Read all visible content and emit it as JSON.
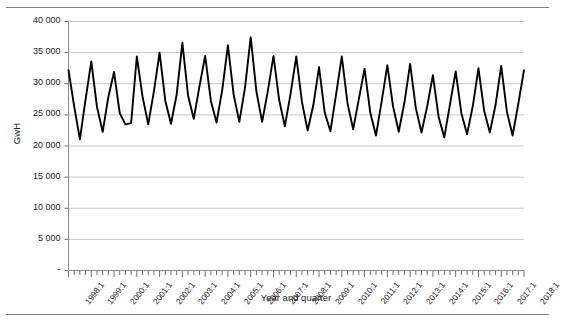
{
  "chart_data": {
    "type": "line",
    "title": "",
    "subtitle": "",
    "xlabel": "Year and quarter",
    "ylabel": "GwH",
    "ylim": [
      0,
      40000
    ],
    "ytick_values": [
      0,
      5000,
      10000,
      15000,
      20000,
      25000,
      30000,
      35000,
      40000
    ],
    "ytick_labels": [
      "-",
      "5 000",
      "10 000",
      "15 000",
      "20 000",
      "25 000",
      "30 000",
      "35 000",
      "40 000"
    ],
    "grid": "horizontal",
    "legend": "none",
    "line_color": "#000000",
    "grid_color": "#c9c9c9",
    "axis_color": "#808080",
    "x_major_labels": [
      "1998:1",
      "1999:1",
      "2000:1",
      "2001:1",
      "2002:1",
      "2003:1",
      "2004:1",
      "2005:1",
      "2006:1",
      "2007:1",
      "2008:1",
      "2009:1",
      "2010:1",
      "2011:1",
      "2012:1",
      "2013:1",
      "2014:1",
      "2015:1",
      "2016:1",
      "2017:1",
      "2018:1"
    ],
    "x_start": "1998:1",
    "x_end": "2018:1",
    "x_period": "quarterly",
    "n_points": 81,
    "x": [
      "1998:1",
      "1998:2",
      "1998:3",
      "1998:4",
      "1999:1",
      "1999:2",
      "1999:3",
      "1999:4",
      "2000:1",
      "2000:2",
      "2000:3",
      "2000:4",
      "2001:1",
      "2001:2",
      "2001:3",
      "2001:4",
      "2002:1",
      "2002:2",
      "2002:3",
      "2002:4",
      "2003:1",
      "2003:2",
      "2003:3",
      "2003:4",
      "2004:1",
      "2004:2",
      "2004:3",
      "2004:4",
      "2005:1",
      "2005:2",
      "2005:3",
      "2005:4",
      "2006:1",
      "2006:2",
      "2006:3",
      "2006:4",
      "2007:1",
      "2007:2",
      "2007:3",
      "2007:4",
      "2008:1",
      "2008:2",
      "2008:3",
      "2008:4",
      "2009:1",
      "2009:2",
      "2009:3",
      "2009:4",
      "2010:1",
      "2010:2",
      "2010:3",
      "2010:4",
      "2011:1",
      "2011:2",
      "2011:3",
      "2011:4",
      "2012:1",
      "2012:2",
      "2012:3",
      "2012:4",
      "2013:1",
      "2013:2",
      "2013:3",
      "2013:4",
      "2014:1",
      "2014:2",
      "2014:3",
      "2014:4",
      "2015:1",
      "2015:2",
      "2015:3",
      "2015:4",
      "2016:1",
      "2016:2",
      "2016:3",
      "2016:4",
      "2017:1",
      "2017:2",
      "2017:3",
      "2017:4",
      "2018:1"
    ],
    "values": [
      32100,
      26300,
      21000,
      27400,
      33500,
      26200,
      22200,
      27800,
      31800,
      25200,
      23400,
      23600,
      34300,
      27900,
      23400,
      28700,
      34900,
      27200,
      23500,
      28200,
      36500,
      28000,
      24300,
      29500,
      34400,
      27200,
      23700,
      28900,
      36100,
      28200,
      23800,
      29300,
      37400,
      28700,
      23800,
      28700,
      34400,
      27300,
      23100,
      28300,
      34300,
      27000,
      22400,
      26500,
      32600,
      25300,
      22300,
      28200,
      34300,
      26800,
      22600,
      27500,
      32300,
      25300,
      21600,
      27100,
      32900,
      26300,
      22200,
      26900,
      33100,
      26000,
      22100,
      26300,
      31300,
      24600,
      21300,
      26600,
      31900,
      25200,
      21800,
      26300,
      32400,
      25600,
      22100,
      26500,
      32800,
      25400,
      21600,
      26700,
      32100
    ]
  }
}
